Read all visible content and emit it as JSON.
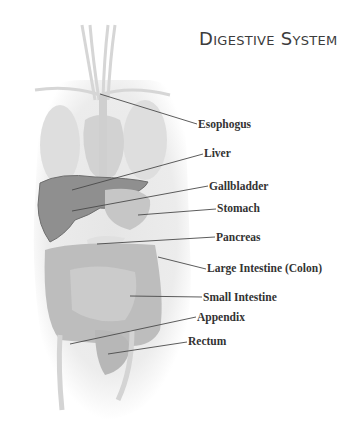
{
  "title": "Digestive System",
  "colors": {
    "body_silhouette": "#e9e9e9",
    "organ_mid": "#c8c8c8",
    "liver": "#8f8f8f",
    "leader_line": "#4a4a4a",
    "label_text": "#333333"
  },
  "labels": [
    {
      "id": "esophogus",
      "text": "Esophogus",
      "x": 198,
      "y": 119
    },
    {
      "id": "liver",
      "text": "Liver",
      "x": 204,
      "y": 148
    },
    {
      "id": "gallbladder",
      "text": "Gallbladder",
      "x": 209,
      "y": 182
    },
    {
      "id": "stomach",
      "text": "Stomach",
      "x": 217,
      "y": 204
    },
    {
      "id": "pancreas",
      "text": "Pancreas",
      "x": 216,
      "y": 233
    },
    {
      "id": "large-intestine",
      "text": "Large Intestine (Colon)",
      "x": 207,
      "y": 263
    },
    {
      "id": "small-intestine",
      "text": "Small Intestine",
      "x": 203,
      "y": 292
    },
    {
      "id": "appendix",
      "text": "Appendix",
      "x": 197,
      "y": 313
    },
    {
      "id": "rectum",
      "text": "Rectum",
      "x": 188,
      "y": 337
    }
  ]
}
